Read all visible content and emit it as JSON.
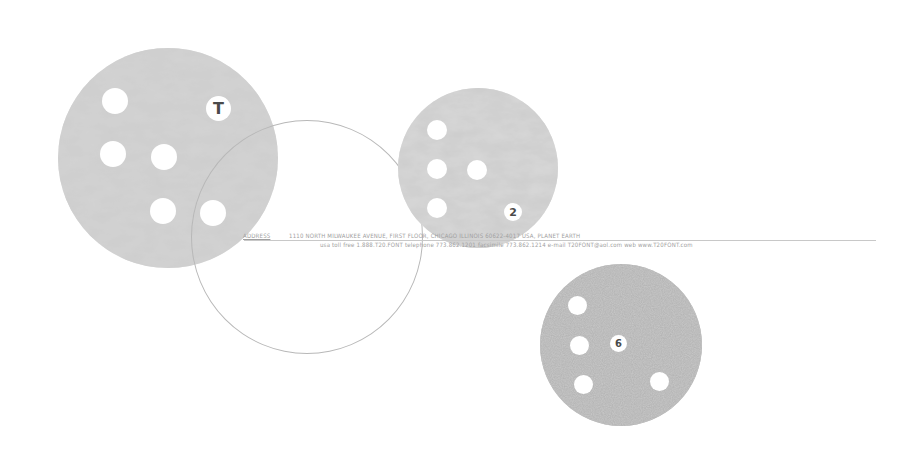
{
  "colors": {
    "background": "#ffffff",
    "disc_texture_light": "#c9c9c9",
    "disc_texture_dark": "#9a9a9a",
    "disc_solid": "#9d9d9d",
    "outline": "#b8b8b8",
    "text": "#a0a0a0"
  },
  "discs": [
    {
      "id": "disc-t",
      "badge": "T"
    },
    {
      "id": "disc-2",
      "badge": "2"
    },
    {
      "id": "disc-6",
      "badge": "6"
    }
  ],
  "address_block": {
    "label": "ADDRESS",
    "line1": "1110 NORTH MILWAUKEE AVENUE, FIRST FLOOR, CHICAGO ILLINOIS 60622-4017 USA, PLANET EARTH",
    "line2": "usa toll free  1.888.T20.FONT   telephone  773.862.1201   facsimile  773.862.1214   e-mail  T20FONT@aol.com   web  www.T20FONT.com"
  }
}
